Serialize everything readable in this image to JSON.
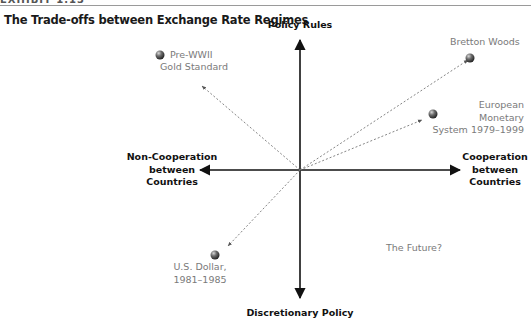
{
  "header": {
    "exhibit_label": "EXHIBIT 1.13",
    "title": "The Trade-offs between Exchange Rate Regimes"
  },
  "axes": {
    "top": "Policy Rules",
    "bottom": "Discretionary Policy",
    "left": [
      "Non-Cooperation",
      "between",
      "Countries"
    ],
    "right": [
      "Cooperation",
      "between",
      "Countries"
    ]
  },
  "regimes": [
    {
      "id": "pre-wwii",
      "lines": [
        "Pre-WWII",
        "Gold Standard"
      ],
      "quadrant": "rules / non-cooperation",
      "marker": true
    },
    {
      "id": "bretton-woods",
      "lines": [
        "Bretton Woods"
      ],
      "quadrant": "rules / cooperation",
      "marker": true
    },
    {
      "id": "ems",
      "lines": [
        "European",
        "Monetary",
        "System 1979–1999"
      ],
      "quadrant": "rules / cooperation",
      "marker": true
    },
    {
      "id": "us-dollar",
      "lines": [
        "U.S. Dollar,",
        "1981–1985"
      ],
      "quadrant": "discretion / non-cooperation",
      "marker": true
    },
    {
      "id": "future",
      "lines": [
        "The Future?"
      ],
      "quadrant": "discretion / cooperation",
      "marker": false
    }
  ],
  "colors": {
    "axis": "#111111",
    "dotted_arrow": "#777777",
    "label_gray": "#7a7a7a",
    "marker_dark": "#3a3a3a",
    "marker_light": "#b5b5b5"
  }
}
